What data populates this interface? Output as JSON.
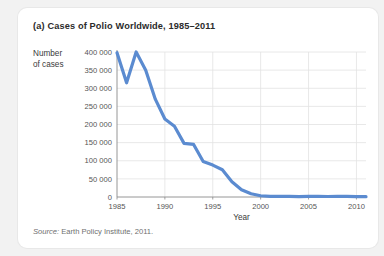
{
  "figure": {
    "title": "(a) Cases of Polio Worldwide, 1985–2011",
    "source_label": "Source:",
    "source_text": " Earth Policy Institute, 2011."
  },
  "colors": {
    "line": "#5b8bd0",
    "gridline": "#e2e2e2",
    "axis": "#8a8a8a",
    "card_background": "#ffffff",
    "page_background": "#f2f2f2",
    "title_text": "#2b2b2b",
    "tick_text": "#555555"
  },
  "chart_data": {
    "type": "line",
    "title": "(a) Cases of Polio Worldwide, 1985–2011",
    "xlabel": "Year",
    "ylabel": "Number of cases",
    "ylabel_lines": [
      "Number",
      "of cases"
    ],
    "xlim": [
      1985,
      2011
    ],
    "ylim": [
      0,
      400000
    ],
    "grid": true,
    "legend": "none",
    "x_ticks": [
      1985,
      1990,
      1995,
      2000,
      2005,
      2010
    ],
    "x_tick_labels": [
      "1985",
      "1990",
      "1995",
      "2000",
      "2005",
      "2010"
    ],
    "y_ticks": [
      0,
      50000,
      100000,
      150000,
      200000,
      250000,
      300000,
      350000,
      400000
    ],
    "y_tick_labels": [
      "0",
      "50 000",
      "100 000",
      "150 000",
      "200 000",
      "250 000",
      "300 000",
      "350 000",
      "400 000"
    ],
    "x": [
      1985,
      1986,
      1987,
      1988,
      1989,
      1990,
      1991,
      1992,
      1993,
      1994,
      1995,
      1996,
      1997,
      1998,
      1999,
      2000,
      2001,
      2002,
      2003,
      2004,
      2005,
      2006,
      2007,
      2008,
      2009,
      2010,
      2011
    ],
    "series": [
      {
        "name": "Polio cases worldwide",
        "values": [
          398000,
          315000,
          400000,
          350000,
          270000,
          215000,
          195000,
          148000,
          145000,
          98000,
          88000,
          75000,
          42000,
          20000,
          9000,
          3500,
          2000,
          1900,
          1500,
          1300,
          1900,
          2000,
          1400,
          1700,
          1600,
          1300,
          1000
        ]
      }
    ]
  }
}
